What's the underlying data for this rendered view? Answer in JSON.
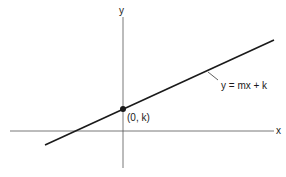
{
  "diagram": {
    "axes": {
      "x_label": "x",
      "y_label": "y"
    },
    "line": {
      "equation_label": "y = mx + k"
    },
    "intercept_point": {
      "label": "(0, k)"
    },
    "colors": {
      "stroke": "#1a1a1a",
      "background": "#ffffff"
    }
  }
}
